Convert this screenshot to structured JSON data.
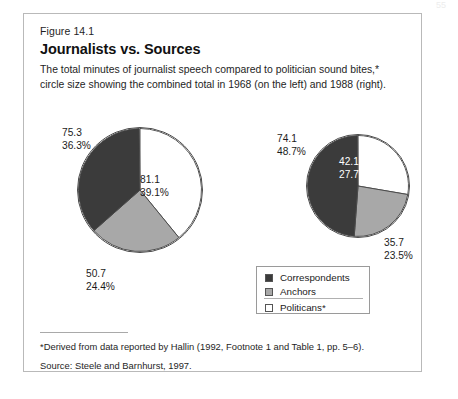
{
  "page": {
    "page_number": "55",
    "figure_number": "Figure 14.1",
    "title": "Journalists vs. Sources",
    "subtitle": "The total minutes of journalist speech compared to politician sound bites,* circle size showing the combined total in 1968 (on the left) and 1988 (right).",
    "footnote": "*Derived from data reported by Hallin (1992, Footnote 1 and Table 1, pp. 5–6).",
    "source": "Source: Steele and Barnhurst, 1997."
  },
  "colors": {
    "correspondents": "#3b3b3b",
    "anchors": "#a8a8a8",
    "politicans": "#ffffff",
    "outline": "#4a4a4a",
    "frame": "#b9b9b9"
  },
  "legend": {
    "items": [
      {
        "label": "Correspondents",
        "swatch": "#3b3b3b",
        "icon": "legend-swatch-dark"
      },
      {
        "label": "Anchors",
        "swatch": "#a8a8a8",
        "icon": "legend-swatch-gray"
      },
      {
        "label": "Politicans*",
        "swatch": "#ffffff",
        "icon": "legend-swatch-white"
      }
    ]
  },
  "chart_data": {
    "type": "pie",
    "title": "Journalists vs. Sources",
    "subtitle": "The total minutes of journalist speech compared to politician sound bites,* circle size showing the combined total in 1968 (on the left) and 1988 (right).",
    "legend_position": "center-right",
    "categories": [
      "Correspondents",
      "Anchors",
      "Politicans*"
    ],
    "unit": "minutes",
    "charts": [
      {
        "name": "1968",
        "year": 1968,
        "total": 207.1,
        "radius_px": 63,
        "slices": [
          {
            "category": "Politicans*",
            "value": 81.1,
            "percent": 39.1,
            "color": "#ffffff",
            "value_label": "81.1",
            "percent_label": "39.1%"
          },
          {
            "category": "Anchors",
            "value": 50.7,
            "percent": 24.4,
            "color": "#a8a8a8",
            "value_label": "50.7",
            "percent_label": "24.4%"
          },
          {
            "category": "Correspondents",
            "value": 75.3,
            "percent": 36.3,
            "color": "#3b3b3b",
            "value_label": "75.3",
            "percent_label": "36.3%"
          }
        ]
      },
      {
        "name": "1988",
        "year": 1988,
        "total": 151.9,
        "radius_px": 52,
        "slices": [
          {
            "category": "Politicans*",
            "value": 42.1,
            "percent": 27.7,
            "color": "#ffffff",
            "value_label": "42.1",
            "percent_label": "27.7%"
          },
          {
            "category": "Anchors",
            "value": 35.7,
            "percent": 23.5,
            "color": "#a8a8a8",
            "value_label": "35.7",
            "percent_label": "23.5%"
          },
          {
            "category": "Correspondents",
            "value": 74.1,
            "percent": 48.7,
            "color": "#3b3b3b",
            "value_label": "74.1",
            "percent_label": "48.7%"
          }
        ]
      }
    ]
  },
  "labels": {
    "p1968_correspondents": "75.3\n36.3%",
    "p1968_politicans": "81.1\n39.1%",
    "p1968_anchors": "50.7\n24.4%",
    "p1988_correspondents": "74.1\n48.7%",
    "p1988_politicans": "42.1\n27.7%",
    "p1988_anchors": "35.7\n23.5%"
  }
}
